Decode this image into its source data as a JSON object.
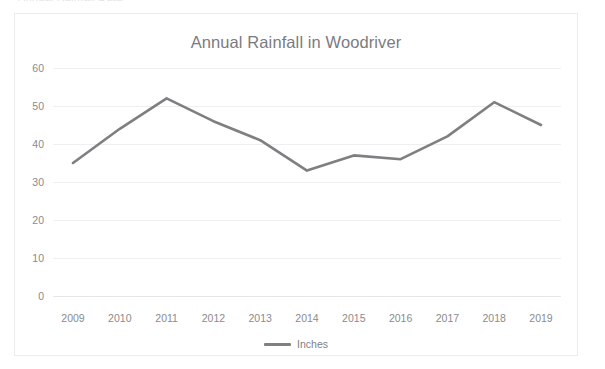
{
  "page": {
    "clipped_top_text": "Annual Rainfall Data"
  },
  "chart": {
    "title": "Annual Rainfall in Woodriver",
    "legend": {
      "label": "Inches",
      "swatch_color": "#808083",
      "position": "bottom-center"
    },
    "colors": {
      "line": "#7f7f82",
      "gridline": "#efeff1",
      "tick_text": "#8a8a8e",
      "title_text": "#7b7b7f",
      "frame_border": "#ececee",
      "background": "#ffffff"
    }
  },
  "chart_data": {
    "type": "line",
    "title": "Annual Rainfall in Woodriver",
    "xlabel": "",
    "ylabel": "",
    "categories": [
      "2009",
      "2010",
      "2011",
      "2012",
      "2013",
      "2014",
      "2015",
      "2016",
      "2017",
      "2018",
      "2019"
    ],
    "series": [
      {
        "name": "Inches",
        "color": "#7f7f82",
        "values": [
          35,
          44,
          52,
          46,
          41,
          33,
          37,
          36,
          42,
          51,
          45
        ]
      }
    ],
    "ylim": [
      0,
      60
    ],
    "yticks": [
      0,
      10,
      20,
      30,
      40,
      50,
      60
    ],
    "ytick_labels": [
      "0",
      "10",
      "20",
      "30",
      "40",
      "50",
      "60"
    ],
    "grid": true,
    "grid_axis": "y",
    "legend_position": "bottom-center",
    "markers": false
  }
}
